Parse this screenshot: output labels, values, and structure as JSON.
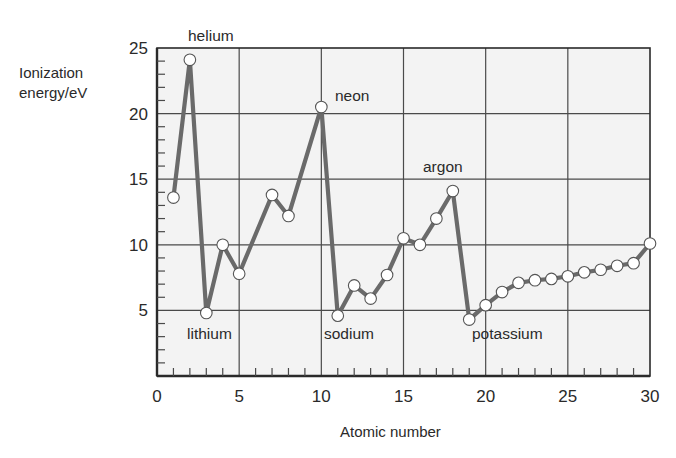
{
  "chart_data": {
    "type": "line",
    "title": "",
    "xlabel": "Atomic number",
    "ylabel_lines": [
      "Ionization",
      "energy/eV"
    ],
    "ylabel": "Ionization energy/eV",
    "xlim": [
      0,
      30
    ],
    "ylim": [
      0,
      25
    ],
    "xticks": [
      0,
      5,
      10,
      15,
      20,
      25,
      30
    ],
    "yticks": [
      5,
      10,
      15,
      20,
      25
    ],
    "x_minor_step": 1,
    "y_minor_step": 1,
    "grid": true,
    "legend": null,
    "series": [
      {
        "name": "First ionization energy",
        "line_color": "#6a6a6a",
        "points": [
          {
            "x": 1,
            "y": 13.6,
            "marker": true
          },
          {
            "x": 2,
            "y": 24.1,
            "marker": true
          },
          {
            "x": 3,
            "y": 4.8,
            "marker": true
          },
          {
            "x": 4,
            "y": 10.0,
            "marker": true
          },
          {
            "x": 5,
            "y": 7.8,
            "marker": true
          },
          {
            "x": 7,
            "y": 13.8,
            "marker": true
          },
          {
            "x": 8,
            "y": 12.2,
            "marker": true
          },
          {
            "x": 10,
            "y": 20.5,
            "marker": true
          },
          {
            "x": 11,
            "y": 4.6,
            "marker": true
          },
          {
            "x": 12,
            "y": 6.9,
            "marker": true
          },
          {
            "x": 13,
            "y": 5.9,
            "marker": true
          },
          {
            "x": 14,
            "y": 7.7,
            "marker": true
          },
          {
            "x": 15,
            "y": 10.5,
            "marker": true
          },
          {
            "x": 16,
            "y": 10.0,
            "marker": true
          },
          {
            "x": 17,
            "y": 12.0,
            "marker": true
          },
          {
            "x": 18,
            "y": 14.1,
            "marker": true
          },
          {
            "x": 19,
            "y": 4.3,
            "marker": true
          },
          {
            "x": 20,
            "y": 5.4,
            "marker": true
          },
          {
            "x": 21,
            "y": 6.4,
            "marker": true
          },
          {
            "x": 22,
            "y": 7.1,
            "marker": true
          },
          {
            "x": 23,
            "y": 7.3,
            "marker": true
          },
          {
            "x": 24,
            "y": 7.4,
            "marker": true
          },
          {
            "x": 25,
            "y": 7.6,
            "marker": true
          },
          {
            "x": 26,
            "y": 7.9,
            "marker": true
          },
          {
            "x": 27,
            "y": 8.1,
            "marker": true
          },
          {
            "x": 28,
            "y": 8.4,
            "marker": true
          },
          {
            "x": 29,
            "y": 8.6,
            "marker": true
          },
          {
            "x": 30,
            "y": 10.1,
            "marker": true
          }
        ],
        "x": [
          1,
          2,
          3,
          4,
          5,
          7,
          8,
          10,
          11,
          12,
          13,
          14,
          15,
          16,
          17,
          18,
          19,
          20,
          21,
          22,
          23,
          24,
          25,
          26,
          27,
          28,
          29,
          30
        ],
        "values": [
          13.6,
          24.1,
          4.8,
          10.0,
          7.8,
          13.8,
          12.2,
          20.5,
          4.6,
          6.9,
          5.9,
          7.7,
          10.5,
          10.0,
          12.0,
          14.1,
          4.3,
          5.4,
          6.4,
          7.1,
          7.3,
          7.4,
          7.6,
          7.9,
          8.1,
          8.4,
          8.6,
          10.1
        ]
      }
    ],
    "annotations": [
      {
        "text": "helium",
        "x": 2,
        "y": 24.1,
        "px": 188,
        "py": 41
      },
      {
        "text": "neon",
        "x": 10,
        "y": 20.5,
        "px": 335,
        "py": 101
      },
      {
        "text": "argon",
        "x": 18,
        "y": 14.1,
        "px": 423,
        "py": 172
      },
      {
        "text": "lithium",
        "x": 3,
        "y": 4.8,
        "px": 187,
        "py": 339
      },
      {
        "text": "sodium",
        "x": 11,
        "y": 4.6,
        "px": 324,
        "py": 339
      },
      {
        "text": "potassium",
        "x": 19,
        "y": 4.3,
        "px": 472,
        "py": 339
      }
    ]
  },
  "colors": {
    "plot_background": "#f3f3f3",
    "grid": "#4a4a4a",
    "axis": "#2a2a2a",
    "line": "#6a6a6a",
    "marker_fill": "#ffffff",
    "marker_stroke": "#555555",
    "text": "#2a2a2a"
  }
}
